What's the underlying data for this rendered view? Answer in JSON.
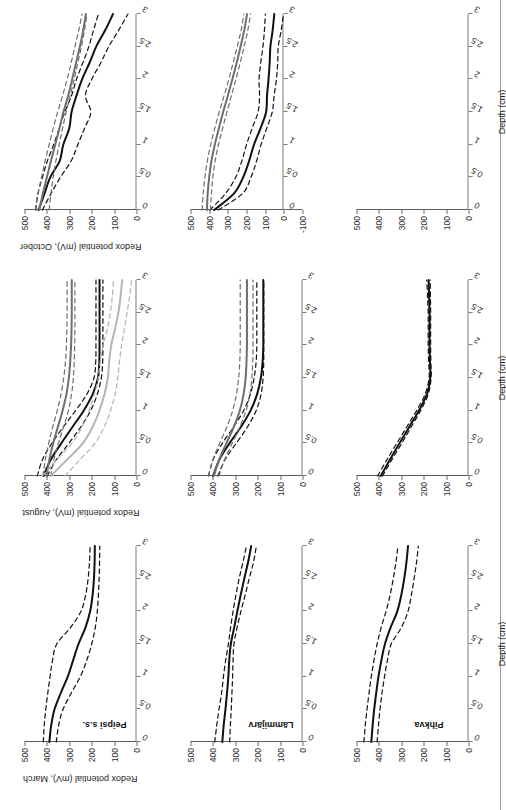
{
  "figure": {
    "orientation": "rotated-90-ccw",
    "sites": [
      "Peipsi s.s.",
      "Lämmijärv",
      "Pihkva"
    ],
    "months": [
      "March",
      "August",
      "October"
    ],
    "x_axis_title": "Depth (cm)",
    "y_axis_titles": {
      "march": "Redox potential (mV), March",
      "august": "Redox potential (mV), August",
      "october": "Redox potential (mV), October"
    },
    "x_ticks": [
      "0",
      "0.5",
      "1",
      "1.5",
      "2",
      "2.5",
      "3"
    ],
    "y_ticks": [
      "0",
      "100",
      "200",
      "300",
      "400",
      "500"
    ],
    "y_ticks_with_negative": [
      "-100",
      "0",
      "100",
      "200",
      "300",
      "400",
      "500"
    ],
    "colors": {
      "series_black": "#111111",
      "series_darkgray": "#6f6f6f",
      "series_lightgray": "#b4b4b4",
      "axis": "#6a6a6a",
      "background": "#ffffff"
    },
    "line_styles": {
      "mean": "solid",
      "bounds": "dashed"
    }
  },
  "chart_data": {
    "type": "line",
    "xlabel": "Depth (cm)",
    "ylabel": "Redox potential (mV)",
    "xlim": [
      0,
      3
    ],
    "ylim": [
      0,
      500
    ],
    "grid": false,
    "legend": "none",
    "x": [
      0,
      0.25,
      0.5,
      0.75,
      1,
      1.25,
      1.5,
      1.75,
      2,
      2.25,
      2.5,
      2.75,
      3
    ],
    "panels": [
      {
        "site": "Peipsi s.s.",
        "month": "March",
        "ylim": [
          0,
          500
        ],
        "series": [
          {
            "name": "Peipsi s.s. March mean",
            "color": "#111111",
            "style": "solid",
            "values": [
              389,
              381,
              366,
              338,
              307,
              283,
              259,
              228,
              207,
              196,
              190,
              187,
              186
            ]
          },
          {
            "name": "Peipsi s.s. March upper bound",
            "color": "#111111",
            "style": "dashed",
            "values": [
              416,
              412,
              405,
              396,
              386,
              375,
              356,
              295,
              248,
              227,
              216,
              210,
              207
            ]
          },
          {
            "name": "Peipsi s.s. March lower bound",
            "color": "#111111",
            "style": "dashed",
            "values": [
              358,
              348,
              328,
              291,
              251,
              222,
              200,
              184,
              175,
              170,
              167,
              165,
              164
            ]
          }
        ]
      },
      {
        "site": "Peipsi s.s.",
        "month": "August",
        "ylim": [
          0,
          500
        ],
        "series": [
          {
            "name": "Peipsi s.s. August mean (black)",
            "color": "#111111",
            "style": "solid",
            "values": [
              415,
              383,
              336,
              286,
              236,
              196,
              172,
              166,
              165,
              165,
              165,
              165,
              165
            ]
          },
          {
            "name": "Peipsi s.s. August upper bound (black)",
            "color": "#111111",
            "style": "dashed",
            "values": [
              443,
              420,
              378,
              327,
              272,
              222,
              190,
              182,
              181,
              181,
              181,
              181,
              181
            ]
          },
          {
            "name": "Peipsi s.s. August lower bound (black)",
            "color": "#111111",
            "style": "dashed",
            "values": [
              399,
              358,
              302,
              249,
              205,
              175,
              157,
              151,
              150,
              150,
              150,
              150,
              150
            ]
          },
          {
            "name": "Peipsi s.s. August mean (dark gray)",
            "color": "#6f6f6f",
            "style": "solid",
            "values": [
              401,
              389,
              372,
              351,
              330,
              313,
              302,
              296,
              292,
              290,
              289,
              289,
              289
            ]
          },
          {
            "name": "Peipsi s.s. August upper bound (dark gray)",
            "color": "#6f6f6f",
            "style": "dashed",
            "values": [
              418,
              407,
              392,
              374,
              354,
              337,
              325,
              317,
              313,
              311,
              310,
              310,
              310
            ]
          },
          {
            "name": "Peipsi s.s. August lower bound (dark gray)",
            "color": "#6f6f6f",
            "style": "dashed",
            "values": [
              383,
              369,
              349,
              326,
              304,
              290,
              282,
              278,
              276,
              275,
              275,
              275,
              275
            ]
          },
          {
            "name": "Peipsi s.s. August mean (light gray)",
            "color": "#b4b4b4",
            "style": "solid",
            "values": [
              383,
              310,
              240,
              196,
              166,
              143,
              128,
              122,
              113,
              96,
              81,
              71,
              64
            ]
          },
          {
            "name": "Peipsi s.s. August upper bound (light gray)",
            "color": "#b4b4b4",
            "style": "dashed",
            "values": [
              420,
              356,
              289,
              243,
              212,
              188,
              171,
              162,
              150,
              130,
              117,
              108,
              103
            ]
          },
          {
            "name": "Peipsi s.s. August lower bound (light gray)",
            "color": "#b4b4b4",
            "style": "dashed",
            "values": [
              320,
              252,
              186,
              144,
              116,
              96,
              84,
              76,
              67,
              54,
              42,
              31,
              22
            ]
          }
        ]
      },
      {
        "site": "Peipsi s.s.",
        "month": "October",
        "ylim": [
          0,
          500
        ],
        "series": [
          {
            "name": "Peipsi s.s. October mean (black)",
            "color": "#111111",
            "style": "solid",
            "values": [
              437,
              411,
              385,
              343,
              327,
              300,
              290,
              268,
              243,
              210,
              180,
              140,
              105
            ]
          },
          {
            "name": "Peipsi s.s. October upper bound (black)",
            "color": "#111111",
            "style": "dashed",
            "values": [
              450,
              440,
              420,
              398,
              370,
              345,
              320,
              290,
              268,
              240,
              213,
              192,
              170
            ]
          },
          {
            "name": "Peipsi s.s. October lower bound (black)",
            "color": "#111111",
            "style": "dashed",
            "values": [
              420,
              382,
              340,
              292,
              262,
              232,
              204,
              228,
              200,
              160,
              124,
              80,
              38
            ]
          },
          {
            "name": "Peipsi s.s. October mean (gray)",
            "color": "#6f6f6f",
            "style": "solid",
            "values": [
              434,
              418,
              400,
              382,
              363,
              344,
              326,
              305,
              287,
              270,
              253,
              238,
              226
            ]
          },
          {
            "name": "Peipsi s.s. October upper bound (gray)",
            "color": "#6f6f6f",
            "style": "dashed",
            "values": [
              452,
              440,
              424,
              408,
              390,
              372,
              352,
              330,
              310,
              292,
              275,
              258,
              243
            ]
          },
          {
            "name": "Peipsi s.s. October lower bound (gray)",
            "color": "#6f6f6f",
            "style": "dashed",
            "values": [
              390,
              382,
              372,
              360,
              345,
              330,
              314,
              296,
              278,
              262,
              246,
              232,
              221
            ]
          }
        ]
      },
      {
        "site": "Lämmijärv",
        "month": "March",
        "ylim": [
          0,
          500
        ],
        "series": [
          {
            "name": "Lämmijärv March mean",
            "color": "#111111",
            "style": "solid",
            "values": [
              358,
              352,
              344,
              337,
              331,
              327,
              320,
              305,
              291,
              276,
              260,
              243,
              229
            ]
          },
          {
            "name": "Lämmijärv March upper bound",
            "color": "#111111",
            "style": "dashed",
            "values": [
              392,
              383,
              373,
              361,
              353,
              343,
              331,
              321,
              310,
              297,
              283,
              266,
              250
            ]
          },
          {
            "name": "Lämmijärv March lower bound",
            "color": "#111111",
            "style": "dashed",
            "values": [
              325,
              322,
              318,
              315,
              312,
              310,
              306,
              292,
              275,
              256,
              238,
              219,
              206
            ]
          }
        ]
      },
      {
        "site": "Lämmijärv",
        "month": "August",
        "ylim": [
          0,
          500
        ],
        "series": [
          {
            "name": "Lämmijärv August mean (black)",
            "color": "#111111",
            "style": "solid",
            "values": [
              399,
              371,
              326,
              275,
              232,
              203,
              186,
              178,
              175,
              175,
              175,
              175,
              175
            ]
          },
          {
            "name": "Lämmijärv August upper bound (black)",
            "color": "#111111",
            "style": "dashed",
            "values": [
              420,
              399,
              358,
              308,
              263,
              233,
              216,
              207,
              204,
              204,
              204,
              204,
              204
            ]
          },
          {
            "name": "Lämmijärv August lower bound (black)",
            "color": "#111111",
            "style": "dashed",
            "values": [
              378,
              346,
              296,
              246,
              207,
              185,
              176,
              173,
              173,
              173,
              173,
              173,
              173
            ]
          },
          {
            "name": "Lämmijärv August mean (gray)",
            "color": "#6f6f6f",
            "style": "solid",
            "values": [
              396,
              372,
              340,
              307,
              280,
              263,
              254,
              250,
              248,
              248,
              248,
              248,
              248
            ]
          },
          {
            "name": "Lämmijärv August upper bound (gray)",
            "color": "#6f6f6f",
            "style": "dashed",
            "values": [
              419,
              400,
              370,
              338,
              312,
              295,
              285,
              280,
              278,
              278,
              278,
              278,
              278
            ]
          },
          {
            "name": "Lämmijärv August lower bound (gray)",
            "color": "#6f6f6f",
            "style": "dashed",
            "values": [
              373,
              348,
              314,
              280,
              252,
              235,
              226,
              222,
              221,
              221,
              221,
              221,
              221
            ]
          }
        ]
      },
      {
        "site": "Lämmijärv",
        "month": "October",
        "ylim": [
          -100,
          500
        ],
        "series": [
          {
            "name": "Lämmijärv October mean (black)",
            "color": "#111111",
            "style": "solid",
            "values": [
              373,
              268,
              218,
              186,
              160,
              125,
              95,
              90,
              82,
              76,
              72,
              60,
              51
            ]
          },
          {
            "name": "Lämmijärv October upper bound (black)",
            "color": "#111111",
            "style": "dashed",
            "values": [
              396,
              313,
              258,
              225,
              200,
              170,
              138,
              130,
              133,
              124,
              112,
              104,
              99
            ]
          },
          {
            "name": "Lämmijärv October lower bound (black)",
            "color": "#111111",
            "style": "dashed",
            "values": [
              352,
              222,
              176,
              146,
              122,
              92,
              62,
              52,
              40,
              33,
              30,
              14,
              2
            ]
          },
          {
            "name": "Lämmijärv October mean (gray)",
            "color": "#6f6f6f",
            "style": "solid",
            "values": [
              412,
              408,
              400,
              388,
              370,
              348,
              325,
              300,
              276,
              253,
              232,
              212,
              197
            ]
          },
          {
            "name": "Lämmijärv October upper bound (gray)",
            "color": "#6f6f6f",
            "style": "dashed",
            "values": [
              438,
              432,
              423,
              410,
              392,
              370,
              346,
              320,
              295,
              272,
              250,
              229,
              214
            ]
          },
          {
            "name": "Lämmijärv October lower bound (gray)",
            "color": "#6f6f6f",
            "style": "dashed",
            "values": [
              393,
              388,
              380,
              368,
              350,
              328,
              305,
              281,
              257,
              234,
              213,
              193,
              178
            ]
          }
        ]
      },
      {
        "site": "Pihkva",
        "month": "March",
        "ylim": [
          0,
          500
        ],
        "series": [
          {
            "name": "Pihkva March mean",
            "color": "#111111",
            "style": "solid",
            "values": [
              434,
              428,
              421,
              412,
              402,
              389,
              373,
              348,
              318,
              300,
              287,
              277,
              270
            ]
          },
          {
            "name": "Pihkva March upper bound",
            "color": "#111111",
            "style": "dashed",
            "values": [
              467,
              461,
              453,
              444,
              434,
              422,
              408,
              390,
              368,
              350,
              336,
              324,
              315
            ]
          },
          {
            "name": "Pihkva March lower bound",
            "color": "#111111",
            "style": "dashed",
            "values": [
              408,
              402,
              395,
              386,
              375,
              362,
              345,
              300,
              270,
              255,
              243,
              232,
              224
            ]
          }
        ]
      },
      {
        "site": "Pihkva",
        "month": "August",
        "ylim": [
          0,
          500
        ],
        "series": [
          {
            "name": "Pihkva August mean",
            "color": "#111111",
            "style": "solid",
            "values": [
              392,
              351,
              308,
              265,
              222,
              186,
              171,
              172,
              174,
              174,
              174,
              176,
              178
            ]
          },
          {
            "name": "Pihkva August upper bound",
            "color": "#111111",
            "style": "dashed",
            "values": [
              406,
              364,
              320,
              276,
              232,
              194,
              176,
              178,
              180,
              180,
              180,
              183,
              186
            ]
          },
          {
            "name": "Pihkva August lower bound",
            "color": "#111111",
            "style": "dashed",
            "values": [
              384,
              342,
              298,
              256,
              214,
              180,
              167,
              168,
              169,
              169,
              169,
              170,
              171
            ]
          }
        ]
      },
      {
        "site": "Pihkva",
        "month": "October",
        "ylim": [
          0,
          500
        ],
        "empty": true,
        "series": []
      }
    ]
  }
}
